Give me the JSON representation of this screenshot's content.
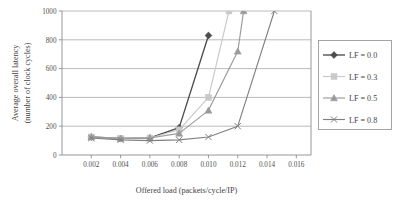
{
  "chart_data": {
    "type": "line",
    "title": "",
    "xlabel": "Offered load (packets/cycle/IP)",
    "ylabel_line1": "Average overall latency",
    "ylabel_line2": "(number of clock cycles)",
    "xlim": [
      0,
      0.017
    ],
    "ylim": [
      0,
      1000
    ],
    "xticks": [
      0.002,
      0.004,
      0.006,
      0.008,
      0.01,
      0.012,
      0.014,
      0.016
    ],
    "xtick_labels": [
      "0.002",
      "0.004",
      "0.006",
      "0.008",
      "0.010",
      "0.012",
      "0.014",
      "0.016"
    ],
    "yticks": [
      0,
      200,
      400,
      600,
      800,
      1000
    ],
    "ytick_labels": [
      "0",
      "200",
      "400",
      "600",
      "800",
      "1000"
    ],
    "grid": "horizontal",
    "legend_position": "right-outside",
    "series": [
      {
        "name": "LF = 0.0",
        "marker": "diamond",
        "color": "#4c4c4c",
        "x": [
          0.002,
          0.004,
          0.006,
          0.008,
          0.01
        ],
        "values": [
          125,
          115,
          118,
          190,
          830
        ]
      },
      {
        "name": "LF = 0.3",
        "marker": "square",
        "color": "#c9c9c9",
        "x": [
          0.002,
          0.004,
          0.006,
          0.008,
          0.01,
          0.0114
        ],
        "values": [
          125,
          115,
          118,
          175,
          400,
          1000
        ]
      },
      {
        "name": "LF = 0.5",
        "marker": "triangle",
        "color": "#9a9a9a",
        "x": [
          0.002,
          0.004,
          0.006,
          0.008,
          0.01,
          0.012,
          0.0124
        ],
        "values": [
          125,
          115,
          118,
          150,
          310,
          720,
          1000
        ]
      },
      {
        "name": "LF = 0.8",
        "marker": "cross",
        "color": "#808080",
        "x": [
          0.002,
          0.004,
          0.006,
          0.008,
          0.01,
          0.012,
          0.0145
        ],
        "values": [
          118,
          105,
          100,
          105,
          125,
          200,
          1000
        ]
      }
    ]
  },
  "legend": {
    "items": [
      {
        "label": "LF = 0.0"
      },
      {
        "label": "LF = 0.3"
      },
      {
        "label": "LF = 0.5"
      },
      {
        "label": "LF = 0.8"
      }
    ]
  }
}
